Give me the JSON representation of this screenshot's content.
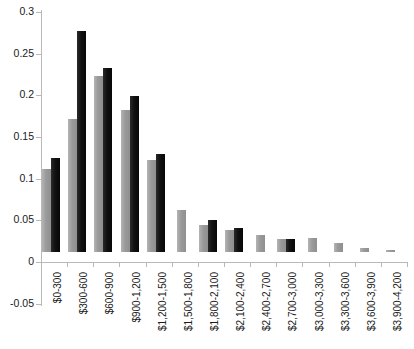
{
  "chart_data": {
    "type": "bar",
    "title": "",
    "xlabel": "",
    "ylabel": "",
    "ylim": [
      -0.05,
      0.3
    ],
    "yticks": [
      -0.05,
      0,
      0.05,
      0.1,
      0.15,
      0.2,
      0.25,
      0.3
    ],
    "ytick_labels": [
      "-0.05",
      "0",
      "0.05",
      "0.1",
      "0.15",
      "0.2",
      "0.25",
      "0.3"
    ],
    "grid": false,
    "legend": "none",
    "categories": [
      "$0-300",
      "$300-600",
      "$600-900",
      "$900-1,200",
      "$1,200-1,500",
      "$1,500-1,800",
      "$1,800-2,100",
      "$2,100-2,400",
      "$2,400-2,700",
      "$2,700-3,000",
      "$3,000-3,300",
      "$3,300-3,600",
      "$3,600-3,900",
      "$3,900-4,200"
    ],
    "series": [
      {
        "name": "Series 1",
        "color": "#9a9a9a",
        "values": [
          0.1,
          0.16,
          0.211,
          0.17,
          0.11,
          0.05,
          0.033,
          0.027,
          0.02,
          0.016,
          0.017,
          0.011,
          0.005,
          0.003
        ]
      },
      {
        "name": "Series 2",
        "color": "#111111",
        "values": [
          0.113,
          0.265,
          0.221,
          0.187,
          0.118,
          0.0,
          0.038,
          0.029,
          0.0,
          0.016,
          0.0,
          0.0,
          0.0,
          0.0
        ]
      }
    ]
  }
}
